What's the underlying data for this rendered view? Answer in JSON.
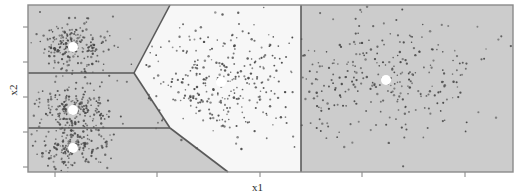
{
  "figure": {
    "title": "",
    "background_color": "#ffffff",
    "width": 525,
    "height": 196
  },
  "axes": {
    "xlabel": "x1",
    "ylabel": "x2",
    "x_tick_positions": [
      55,
      157,
      260,
      362,
      465
    ],
    "y_tick_positions": [
      27,
      62,
      97,
      132,
      167
    ],
    "x_tick_labels": [
      "",
      "",
      "",
      "",
      ""
    ],
    "y_tick_labels": [
      "",
      "",
      "",
      "",
      ""
    ],
    "frame_color": "#808080",
    "tick_color": "#808080"
  },
  "chart_data": {
    "type": "scatter",
    "title": "",
    "xlabel": "x1",
    "ylabel": "x2",
    "grid": false,
    "legend": null,
    "xlim": [
      0,
      1
    ],
    "ylim": [
      0,
      1
    ],
    "region_fill_colors": [
      "#cccccc",
      "#f7f7f7"
    ],
    "boundary_color": "#5a5a5a",
    "point_color": "#4a4a4a",
    "centroid_color": "#ffffff",
    "regions": [
      {
        "name": "top-left-region",
        "fill": "#cccccc",
        "polygon": "28,5 28,73 134,73 170,5"
      },
      {
        "name": "middle-left-region",
        "fill": "#cccccc",
        "polygon": "28,73 28,128 170,128 134,73"
      },
      {
        "name": "bottom-left-region",
        "fill": "#cccccc",
        "polygon": "28,128 28,172 228,172 170,128"
      },
      {
        "name": "center-white-region",
        "fill": "#f7f7f7",
        "polygon": "170,5 134,73 170,128 228,172 301,172 301,5"
      },
      {
        "name": "right-region",
        "fill": "#cccccc",
        "polygon": "301,5 301,172 513,172 513,5"
      }
    ],
    "boundaries": [
      {
        "name": "upper-diagonal",
        "x1": 170,
        "y1": 5,
        "x2": 134,
        "y2": 73
      },
      {
        "name": "upper-horizontal",
        "x1": 28,
        "y1": 73,
        "x2": 134,
        "y2": 73
      },
      {
        "name": "lower-diagonal",
        "x1": 134,
        "y1": 73,
        "x2": 170,
        "y2": 128
      },
      {
        "name": "lower-horizontal",
        "x1": 28,
        "y1": 128,
        "x2": 170,
        "y2": 128
      },
      {
        "name": "bottom-diagonal",
        "x1": 170,
        "y1": 128,
        "x2": 228,
        "y2": 172
      },
      {
        "name": "right-vertical",
        "x1": 301,
        "y1": 5,
        "x2": 301,
        "y2": 172
      }
    ],
    "centroids": [
      {
        "name": "centroid-1",
        "x": 73,
        "y": 47
      },
      {
        "name": "centroid-2",
        "x": 73,
        "y": 110
      },
      {
        "name": "centroid-3",
        "x": 73,
        "y": 148
      },
      {
        "name": "centroid-4",
        "x": 221,
        "y": 82
      },
      {
        "name": "centroid-5",
        "x": 386,
        "y": 80
      }
    ],
    "clusters": [
      {
        "name": "cluster-top-left",
        "cx": 73,
        "cy": 47,
        "sx": 17,
        "sy": 13,
        "n": 210
      },
      {
        "name": "cluster-middle-left",
        "cx": 73,
        "cy": 110,
        "sx": 17,
        "sy": 12,
        "n": 200
      },
      {
        "name": "cluster-bottom-left",
        "cx": 73,
        "cy": 148,
        "sx": 17,
        "sy": 12,
        "n": 190
      },
      {
        "name": "cluster-center",
        "cx": 221,
        "cy": 82,
        "sx": 38,
        "sy": 28,
        "n": 300
      },
      {
        "name": "cluster-right",
        "cx": 386,
        "cy": 80,
        "sx": 52,
        "sy": 32,
        "n": 300
      }
    ]
  }
}
